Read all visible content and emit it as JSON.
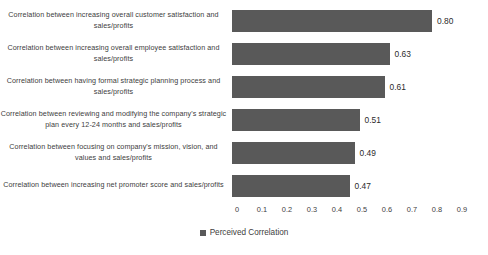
{
  "chart_data": {
    "type": "bar",
    "orientation": "horizontal",
    "title": "",
    "subtitle": "",
    "xlabel": "",
    "ylabel": "",
    "xlim": [
      0,
      0.9
    ],
    "grid": false,
    "legend_position": "bottom-center",
    "bar_color": "#595959",
    "categories": [
      "Correlation between increasing overall customer satisfaction and sales/profits",
      "Correlation between increasing overall employee satisfaction and sales/profits",
      "Correlation between having formal strategic planning process and sales/profits",
      "Correlation between reviewing and modifying the company's strategic plan every 12-24 months and sales/profits",
      "Correlation between focusing on company's mission, vision, and values and sales/profits",
      "Correlation between increasing net promoter score and sales/profits"
    ],
    "values": [
      0.8,
      0.63,
      0.61,
      0.51,
      0.49,
      0.47
    ],
    "value_labels": [
      "0.80",
      "0.63",
      "0.61",
      "0.51",
      "0.49",
      "0.47"
    ],
    "series": [
      {
        "name": "Perceived Correlation",
        "values": [
          0.8,
          0.63,
          0.61,
          0.51,
          0.49,
          0.47
        ]
      }
    ],
    "xticks": [
      0,
      0.1,
      0.2,
      0.3,
      0.4,
      0.5,
      0.6,
      0.7,
      0.8,
      0.9
    ],
    "xtick_labels": [
      "0",
      "0.1",
      "0.2",
      "0.3",
      "0.4",
      "0.5",
      "0.6",
      "0.7",
      "0.8",
      "0.9"
    ],
    "legend": [
      {
        "label": "Perceived Correlation",
        "color": "#595959",
        "marker": "square-swatch-icon"
      }
    ]
  }
}
